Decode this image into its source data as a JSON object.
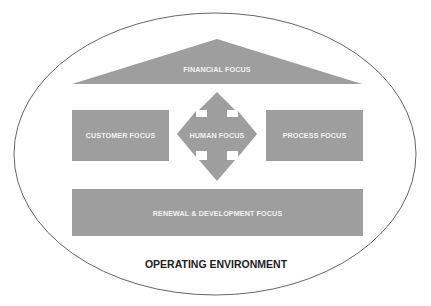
{
  "diagram": {
    "type": "framework",
    "nodes": {
      "financial": {
        "label": "FINANCIAL FOCUS",
        "shape": "triangle-roof"
      },
      "customer": {
        "label": "CUSTOMER FOCUS",
        "shape": "rectangle"
      },
      "human": {
        "label": "HUMAN FOCUS",
        "shape": "four-way-arrow"
      },
      "process": {
        "label": "PROCESS FOCUS",
        "shape": "rectangle"
      },
      "renewal": {
        "label": "RENEWAL & DEVELOPMENT FOCUS",
        "shape": "rectangle"
      }
    },
    "environment": {
      "label": "OPERATING ENVIRONMENT",
      "shape": "ellipse"
    },
    "colors": {
      "shape_fill": "#9e9e9e",
      "shape_text": "#f2f2f2",
      "outline": "#555555",
      "environment_text": "#222222",
      "background": "#ffffff"
    }
  }
}
